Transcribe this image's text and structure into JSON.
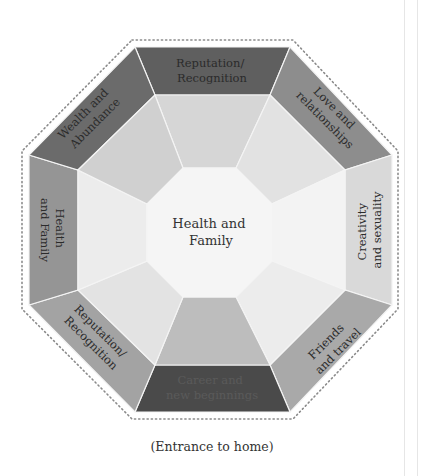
{
  "diagram": {
    "center": {
      "label_lines": [
        "Health and",
        "Family"
      ]
    },
    "segments": [
      {
        "position": "top",
        "label_lines": [
          "Reputation/",
          "Recognition"
        ],
        "outer_color": "#5f5f5f",
        "inner_color": "#d6d6d6"
      },
      {
        "position": "top-right",
        "label_lines": [
          "Love and",
          "relationships"
        ],
        "outer_color": "#8d8d8d",
        "inner_color": "#e2e2e2"
      },
      {
        "position": "right",
        "label_lines": [
          "Creativity",
          "and sexuality"
        ],
        "outer_color": "#d9d9d9",
        "inner_color": "#f3f3f3"
      },
      {
        "position": "bottom-right",
        "label_lines": [
          "Friends",
          "and travel"
        ],
        "outer_color": "#a9a9a9",
        "inner_color": "#ececec"
      },
      {
        "position": "bottom",
        "label_lines": [
          "Career and",
          "new beginnings"
        ],
        "outer_color": "#4a4a4a",
        "inner_color": "#bdbdbd"
      },
      {
        "position": "bottom-left",
        "label_lines": [
          "Reputation/",
          "Recognition"
        ],
        "outer_color": "#a3a3a3",
        "inner_color": "#e3e3e3"
      },
      {
        "position": "left",
        "label_lines": [
          "Health",
          "and Family"
        ],
        "outer_color": "#959595",
        "inner_color": "#ececec"
      },
      {
        "position": "top-left",
        "label_lines": [
          "Wealth and",
          "Abundance"
        ],
        "outer_color": "#6b6b6b",
        "inner_color": "#d0d0d0"
      }
    ],
    "caption": "(Entrance to home)",
    "colors": {
      "center_fill": "#f5f5f5",
      "divider": "#f4f4f4",
      "dotted_border": "#8a8a8a"
    }
  }
}
